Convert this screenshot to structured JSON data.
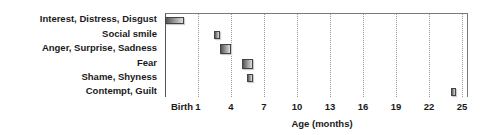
{
  "chart_data": {
    "type": "bar",
    "subtype": "horizontal-range (emergence timeline)",
    "title": "",
    "xlabel": "Age (months)",
    "ylabel": "",
    "x_ticks": [
      "Birth",
      "1",
      "4",
      "7",
      "10",
      "13",
      "16",
      "19",
      "22",
      "25"
    ],
    "x_tick_values": [
      0,
      1,
      4,
      7,
      10,
      13,
      16,
      19,
      22,
      25
    ],
    "xlim": [
      0,
      25.2
    ],
    "grid": "vertical dotted",
    "legend": null,
    "categories": [
      "Interest, Distress, Disgust",
      "Social smile",
      "Anger, Surprise, Sadness",
      "Fear",
      "Shame, Shyness",
      "Contempt, Guilt"
    ],
    "series": [
      {
        "name": "Emergence age range",
        "ranges": [
          {
            "category": "Interest, Distress, Disgust",
            "start": 0,
            "end": 0.6
          },
          {
            "category": "Social smile",
            "start": 2.5,
            "end": 3.0
          },
          {
            "category": "Anger, Surprise, Sadness",
            "start": 3.0,
            "end": 4.0
          },
          {
            "category": "Fear",
            "start": 5.0,
            "end": 6.0
          },
          {
            "category": "Shame, Shyness",
            "start": 5.5,
            "end": 6.0
          },
          {
            "category": "Contempt, Guilt",
            "start": 24.0,
            "end": 24.5
          }
        ]
      }
    ]
  }
}
